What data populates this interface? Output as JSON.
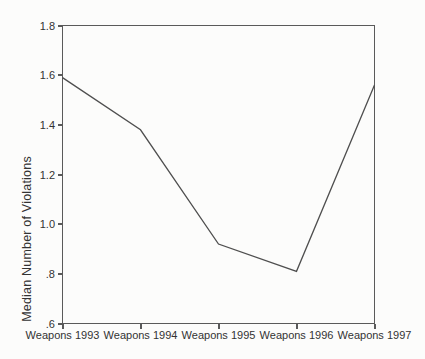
{
  "figure": {
    "background_color": "#fcfcfb",
    "text_color": "#333333"
  },
  "chart_data": {
    "type": "line",
    "title": "",
    "xlabel": "",
    "ylabel": "Median Number of Violations",
    "categories": [
      "Weapons 1993",
      "Weapons 1994",
      "Weapons 1995",
      "Weapons 1996",
      "Weapons 1997"
    ],
    "values": [
      1.59,
      1.38,
      0.92,
      0.81,
      1.56
    ],
    "ylim": [
      0.6,
      1.8
    ],
    "yticks": [
      1.8,
      1.6,
      1.4,
      1.2,
      1.0,
      0.8,
      0.6
    ],
    "ytick_labels": [
      "1.8",
      "1.6",
      "1.4",
      "1.2",
      "1.0",
      ".8",
      ".6"
    ],
    "grid": false,
    "legend": "none",
    "marker": "none",
    "line_color": "#4f4f4f",
    "frame_color": "#5a5a5a"
  }
}
